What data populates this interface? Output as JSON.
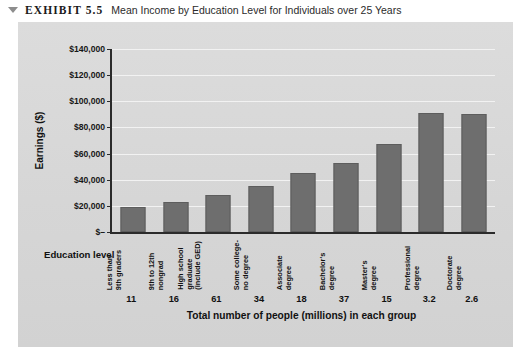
{
  "caption": {
    "marker_icon": "collapse-triangle-icon",
    "exhibit_label": "EXHIBIT 5.5",
    "title": "Mean Income by Education Level for Individuals over 25 Years"
  },
  "chart_data": {
    "type": "bar",
    "title": "Mean Income by Education Level for Individuals over 25 Years",
    "xlabel": "Total number of people (millions) in each group",
    "ylabel": "Earnings ($)",
    "secondary_xlabel": "Education level",
    "ylim": [
      0,
      140000
    ],
    "ytick_values": [
      0,
      20000,
      40000,
      60000,
      80000,
      100000,
      120000,
      140000
    ],
    "ytick_labels": [
      "$–",
      "$20,000",
      "$40,000",
      "$60,000",
      "$80,000",
      "$100,000",
      "$120,000",
      "$140,000"
    ],
    "grid": true,
    "legend": "none",
    "bar_color": "#6e6e6e",
    "plot_background": "#d9d9d9",
    "categories": [
      "Less than\n9th graders",
      "9th to 12th\nnongrad",
      "High school\ngraduate\n(include GED)",
      "Some college-\nno degree",
      "Associate\ndegree",
      "Bachelor's\ndegree",
      "Master's\ndegree",
      "Professional\ndegree",
      "Doctorate\ndegree"
    ],
    "category_lines": [
      [
        "Less than",
        "9th graders"
      ],
      [
        "9th to 12th",
        "nongrad"
      ],
      [
        "High school",
        "graduate",
        "(include GED)"
      ],
      [
        "Some college-",
        "no degree"
      ],
      [
        "Associate",
        "degree"
      ],
      [
        "Bachelor's",
        "degree"
      ],
      [
        "Master's",
        "degree"
      ],
      [
        "Professional",
        "degree"
      ],
      [
        "Doctorate",
        "degree"
      ]
    ],
    "values": [
      19000,
      23000,
      28000,
      35000,
      45000,
      53000,
      67000,
      91000,
      90000
    ],
    "counts": [
      "11",
      "16",
      "61",
      "34",
      "18",
      "37",
      "15",
      "3.2",
      "2.6"
    ],
    "counts_label": "Total number of people (millions) in each group"
  }
}
